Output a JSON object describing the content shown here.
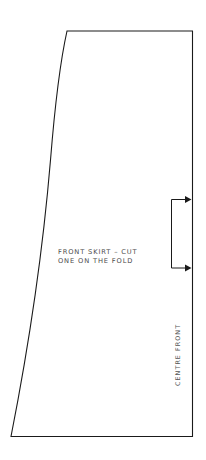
{
  "canvas": {
    "width": 206,
    "height": 460,
    "background_color": "#ffffff",
    "line_color": "#1a1a1a",
    "text_color": "#4a4a4a"
  },
  "pattern": {
    "title": "Front Skirt Pattern Piece",
    "shape_name": "skirt-panel-outline",
    "edges": {
      "top": "waist-edge",
      "left": "side-seam-curved-edge",
      "right": "centre-front-fold-edge",
      "bottom": "hem-edge"
    },
    "outline_path": "M 67 31 L 192.5 31 L 192.5 436.5 L 11 436.5 C 30 340 44 238 50.5 160 C 55 104 61 58 67 31 Z",
    "corners": {
      "top_left": [
        67,
        31
      ],
      "top_right": [
        192.5,
        31
      ],
      "bottom_right": [
        192.5,
        436.5
      ],
      "bottom_left": [
        11,
        436.5
      ]
    }
  },
  "annotations": {
    "piece_label": {
      "name": "front-skirt-cut-label",
      "line1": "FRONT SKIRT – CUT",
      "line2": "ONE ON THE FOLD",
      "x": 58,
      "y_line1": 254,
      "y_line2": 263
    },
    "grain_label": {
      "name": "centre-front-label",
      "text": "CENTRE FRONT",
      "rotation_degrees": -90,
      "x": 180,
      "y": 386
    }
  },
  "fold_marker": {
    "name": "fold-bracket-marker",
    "bracket_path": "M 190 199.5 L 171.5 199.5 L 171.5 268 L 190 268",
    "arrows": [
      {
        "name": "fold-arrow-top",
        "points": "191.5,199.5 185,196 185,203",
        "direction": "right",
        "y": 199.5
      },
      {
        "name": "fold-arrow-bottom",
        "points": "191.5,268 185,264.5 185,271.5",
        "direction": "right",
        "y": 268
      }
    ]
  }
}
